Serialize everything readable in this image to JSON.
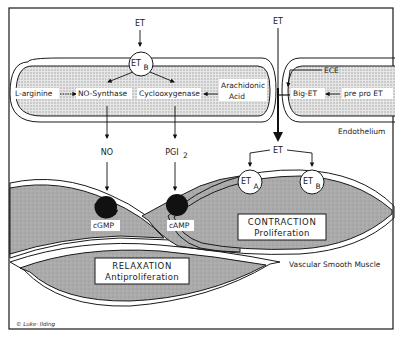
{
  "diagram": {
    "colors": {
      "frame": "#1a1a1a",
      "endothelium_fill": "#cfcfcf",
      "muscle_fill": "#a9a9a9",
      "receptor_fill": "#ffffff",
      "black_receptor": "#111111",
      "arrow": "#111111"
    },
    "labels": {
      "et_top_left": "ET",
      "et_top_right": "ET",
      "etb_receptor_main": "ET",
      "etb_receptor_main_sub": "B",
      "l_arginine": "L-arginine",
      "no_synthase": "NO-Synthase",
      "cyclooxygenase": "Cyclooxygenase",
      "arachidonic_acid_line1": "Arachidonic",
      "arachidonic_acid_line2": "Acid",
      "ece": "ECE",
      "big_et": "Big-ET",
      "pre_pro_et": "pre pro ET",
      "endothelium": "Endothelium",
      "no": "NO",
      "pgi": "PGI",
      "pgi_sub": "2",
      "et_middle": "ET",
      "eta_receptor": "ET",
      "eta_receptor_sub": "A",
      "etb_receptor_muscle": "ET",
      "etb_receptor_muscle_sub": "B",
      "cgmp": "cGMP",
      "camp": "cAMP",
      "contraction_title": "CONTRACTION",
      "contraction_sub": "Proliferation",
      "relaxation_title": "RELAXATION",
      "relaxation_sub": "Antiproliferation",
      "vascular_smooth_muscle": "Vascular  Smooth Muscle",
      "signature": "© Luke· Ilding"
    }
  }
}
